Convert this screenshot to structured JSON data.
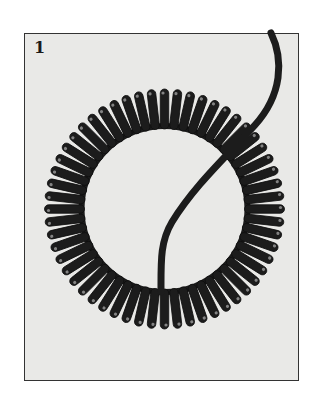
{
  "figure": {
    "panel_number": "1",
    "colors": {
      "page_background": "#ffffff",
      "panel_background": "#e9e9e7",
      "ink": "#1c1c1c",
      "highlight": "#d8d8d8"
    },
    "coil": {
      "center": [
        164.5,
        209
      ],
      "outer_radius": 120,
      "inner_radius": 80,
      "loop_count": 56
    },
    "cord_path": "M271,33 C284,60 282,95 255,125 C225,158 195,185 172,222 C160,242 161,262 161,292"
  }
}
